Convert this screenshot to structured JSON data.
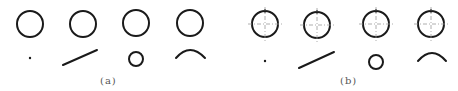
{
  "figure": {
    "stroke_color": "#1a1a1a",
    "center_mark_color": "#9a9a9a",
    "panels": [
      {
        "id": "a",
        "label": "(a)",
        "label_pos": [
          100,
          75
        ],
        "large_circles": [
          {
            "cx": 30,
            "cy": 24,
            "r": 13
          },
          {
            "cx": 83,
            "cy": 24,
            "r": 13
          },
          {
            "cx": 136,
            "cy": 23,
            "r": 13
          },
          {
            "cx": 190,
            "cy": 23,
            "r": 13
          }
        ],
        "show_center_marks": false,
        "primitives": [
          {
            "type": "point",
            "cx": 30,
            "cy": 58
          },
          {
            "type": "line",
            "x1": 63,
            "y1": 65,
            "x2": 97,
            "y2": 50
          },
          {
            "type": "circle",
            "cx": 136,
            "cy": 59,
            "r": 7
          },
          {
            "type": "arc",
            "x1": 176,
            "y1": 58,
            "peak_x": 190,
            "peak_y": 50,
            "x2": 205,
            "y2": 58
          }
        ]
      },
      {
        "id": "b",
        "label": "(b)",
        "label_pos": [
          340,
          75
        ],
        "large_circles": [
          {
            "cx": 265,
            "cy": 24,
            "r": 13
          },
          {
            "cx": 317,
            "cy": 25,
            "r": 13
          },
          {
            "cx": 376,
            "cy": 24,
            "r": 13
          },
          {
            "cx": 431,
            "cy": 24,
            "r": 13
          }
        ],
        "show_center_marks": true,
        "primitives": [
          {
            "type": "point",
            "cx": 265,
            "cy": 61
          },
          {
            "type": "line",
            "x1": 299,
            "y1": 68,
            "x2": 334,
            "y2": 52
          },
          {
            "type": "circle",
            "cx": 376,
            "cy": 62,
            "r": 7
          },
          {
            "type": "arc",
            "x1": 418,
            "y1": 61,
            "peak_x": 432,
            "peak_y": 53,
            "x2": 446,
            "y2": 61
          }
        ]
      }
    ]
  }
}
